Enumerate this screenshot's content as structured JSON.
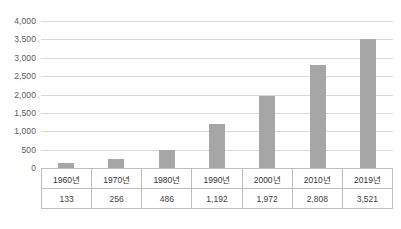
{
  "chart_data": {
    "type": "bar",
    "title": "",
    "xlabel": "",
    "ylabel": "",
    "categories": [
      "1960년",
      "1970년",
      "1980년",
      "1990년",
      "2000년",
      "2010년",
      "2019년"
    ],
    "values": [
      133,
      256,
      486,
      1192,
      1972,
      2808,
      3521
    ],
    "value_labels": [
      "133",
      "256",
      "486",
      "1,192",
      "1,972",
      "2,808",
      "3,521"
    ],
    "ylim": [
      0,
      4000
    ],
    "ytick_values": [
      0,
      500,
      1000,
      1500,
      2000,
      2500,
      3000,
      3500,
      4000
    ],
    "ytick_labels": [
      "0",
      "500",
      "1,000",
      "1,500",
      "2,000",
      "2,500",
      "3,000",
      "3,500",
      "4,000"
    ],
    "grid": true,
    "legend": "none",
    "bar_color": "#a6a6a6",
    "gridline_color": "#d9d9d9",
    "data_table_visible": true
  },
  "caption": {
    "text": ""
  }
}
